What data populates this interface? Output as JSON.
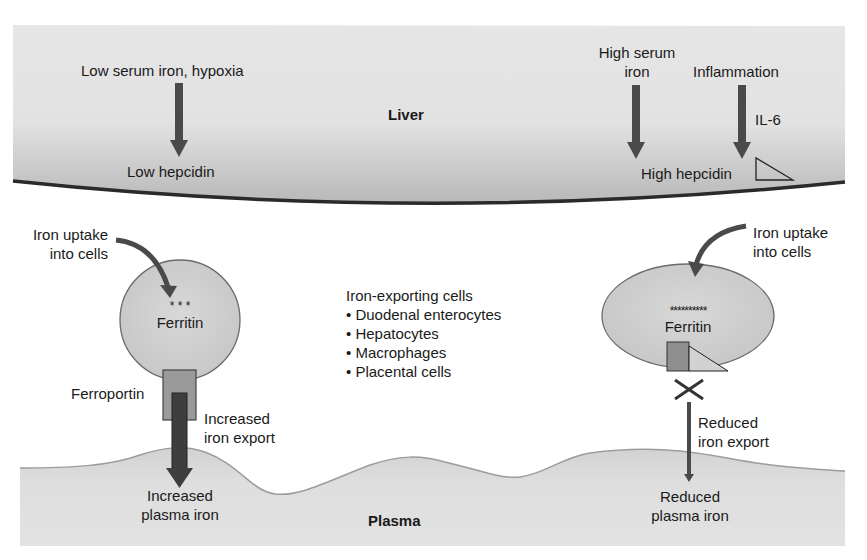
{
  "liver": {
    "label": "Liver",
    "left": {
      "trigger": "Low serum iron, hypoxia",
      "result": "Low hepcidin"
    },
    "right": {
      "trigger1_line1": "High serum",
      "trigger1_line2": "iron",
      "trigger2": "Inflammation",
      "mediator": "IL-6",
      "result": "High hepcidin"
    }
  },
  "left_cell": {
    "uptake_line1": "Iron uptake",
    "uptake_line2": "into cells",
    "stores": "* * *",
    "ferritin": "Ferritin",
    "ferroportin": "Ferroportin",
    "export_line1": "Increased",
    "export_line2": "iron export",
    "plasma_line1": "Increased",
    "plasma_line2": "plasma iron"
  },
  "center_list": {
    "title": "Iron-exporting cells",
    "items": [
      "• Duodenal enterocytes",
      "• Hepatocytes",
      "• Macrophages",
      "• Placental cells"
    ]
  },
  "right_cell": {
    "uptake_line1": "Iron uptake",
    "uptake_line2": "into cells",
    "stores": "**********",
    "ferritin": "Ferritin",
    "export_line1": "Reduced",
    "export_line2": "iron export",
    "plasma_line1": "Reduced",
    "plasma_line2": "plasma iron"
  },
  "plasma": {
    "label": "Plasma"
  },
  "colors": {
    "band_fill": "#e4e4e4",
    "band_shadow": "#c4c4c4",
    "cell_fill": "#cfcfcf",
    "cell_border": "#6a6a6a",
    "arrow": "#4a4a4a",
    "ferroportin_outer": "#9a9a9a",
    "ferroportin_inner": "#3e3e3e",
    "liver_border": "#2a2a2a",
    "plasma_border": "#9c9c9c"
  }
}
